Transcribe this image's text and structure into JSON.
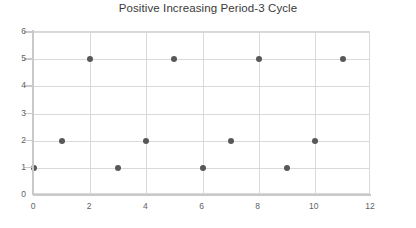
{
  "chart_data": {
    "type": "scatter",
    "title": "Positive Increasing Period-3 Cycle",
    "xlabel": "",
    "ylabel": "",
    "x": [
      0,
      1,
      2,
      3,
      4,
      5,
      6,
      7,
      8,
      9,
      10,
      11
    ],
    "values": [
      1,
      2,
      5,
      1,
      2,
      5,
      1,
      2,
      5,
      1,
      2,
      5
    ],
    "points": [
      {
        "x": 0,
        "y": 1
      },
      {
        "x": 1,
        "y": 2
      },
      {
        "x": 2,
        "y": 5
      },
      {
        "x": 3,
        "y": 1
      },
      {
        "x": 4,
        "y": 2
      },
      {
        "x": 5,
        "y": 5
      },
      {
        "x": 6,
        "y": 1
      },
      {
        "x": 7,
        "y": 2
      },
      {
        "x": 8,
        "y": 5
      },
      {
        "x": 9,
        "y": 1
      },
      {
        "x": 10,
        "y": 2
      },
      {
        "x": 11,
        "y": 5
      }
    ],
    "xlim": [
      0,
      12
    ],
    "ylim": [
      0,
      6
    ],
    "xticks": [
      0,
      2,
      4,
      6,
      8,
      10,
      12
    ],
    "xtick_labels": [
      "0",
      "2",
      "4",
      "6",
      "8",
      "10",
      "12"
    ],
    "yticks": [
      0,
      1,
      2,
      3,
      4,
      5,
      6
    ],
    "ytick_labels": [
      "0",
      "1",
      "2",
      "3",
      "4",
      "5",
      "6"
    ],
    "x_gridlines": [
      2,
      4,
      6,
      8,
      10
    ],
    "y_gridlines": [
      1,
      2,
      3,
      4,
      5,
      6
    ],
    "grid": true,
    "legend": false,
    "legend_position": "none",
    "marker_color": "#585858",
    "gridline_color": "#d9d9d9",
    "axis_color": "#c9c9c9",
    "title_color": "#3a3a3a",
    "tick_label_color": "#5f5f5f",
    "background_color": "#ffffff"
  }
}
